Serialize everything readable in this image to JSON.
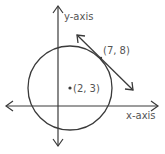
{
  "diagram": {
    "type": "circle-with-tangent-line",
    "colors": {
      "stroke": "#3a3a3a",
      "text": "#555555",
      "background": "#ffffff"
    },
    "axes": {
      "x_label": "x-axis",
      "y_label": "y-axis"
    },
    "circle": {
      "center_label": "(2, 3)",
      "center": [
        2,
        3
      ]
    },
    "tangent": {
      "point_label": "(7, 8)",
      "point": [
        7,
        8
      ]
    }
  }
}
